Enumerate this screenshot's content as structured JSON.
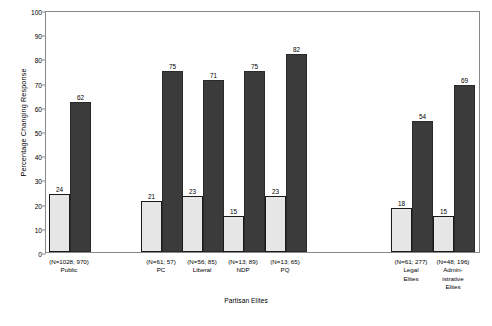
{
  "chart_data": {
    "type": "bar",
    "title": "",
    "xlabel": "Partisan Elites",
    "ylabel": "Percentage Changing Response",
    "ylim": [
      0,
      100
    ],
    "ytick_values": [
      0,
      10,
      20,
      30,
      40,
      50,
      60,
      70,
      80,
      90,
      100
    ],
    "grid": false,
    "legend": "none",
    "categories": [
      "Public",
      "PC",
      "Liberal",
      "NDP",
      "PQ",
      "Legal\nElites",
      "Admin-\nistrative\nElites"
    ],
    "category_n_labels": [
      "(N=1028; 970)",
      "(N=61; 57)",
      "(N=56; 85)",
      "(N=13; 89)",
      "(N=13; 65)",
      "(N=61; 277)",
      "(N=48; 196)"
    ],
    "series": [
      {
        "name": "light",
        "values": [
          24,
          21,
          23,
          15,
          23,
          18,
          15
        ]
      },
      {
        "name": "dark",
        "values": [
          62,
          75,
          71,
          75,
          82,
          54,
          69
        ]
      }
    ],
    "colors": {
      "light_bar": "#e6e6e6",
      "dark_bar": "#3b3b3b",
      "bar_border": "#1a1a1a",
      "axis": "#888888",
      "text": "#000000"
    }
  },
  "groups": [
    {
      "label": "Public",
      "n": "(N=1028; 970)",
      "light": 24,
      "dark": 62,
      "x": 48,
      "labelx": 41
    },
    {
      "label": "PC",
      "n": "(N=61; 57)",
      "light": 21,
      "dark": 75,
      "x": 140,
      "labelx": 133
    },
    {
      "label": "Liberal",
      "n": "(N=56; 85)",
      "light": 23,
      "dark": 71,
      "x": 181,
      "labelx": 174
    },
    {
      "label": "NDP",
      "n": "(N=13; 89)",
      "light": 15,
      "dark": 75,
      "x": 222,
      "labelx": 215
    },
    {
      "label": "PQ",
      "n": "(N=13; 65)",
      "light": 23,
      "dark": 82,
      "x": 264,
      "labelx": 257
    },
    {
      "label": "Legal\nElites",
      "n": "(N=61; 277)",
      "light": 18,
      "dark": 54,
      "x": 390,
      "labelx": 383
    },
    {
      "label": "Admin-\nistrative\nElites",
      "n": "(N=48; 196)",
      "light": 15,
      "dark": 69,
      "x": 432,
      "labelx": 425
    }
  ]
}
